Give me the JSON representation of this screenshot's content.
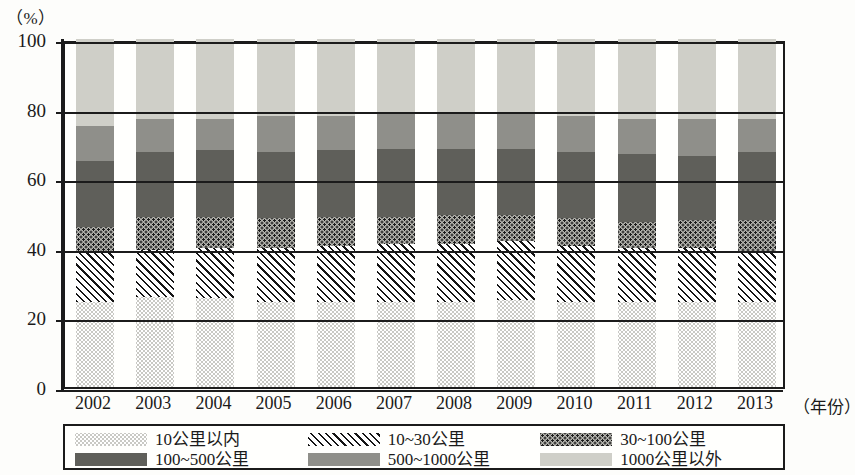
{
  "axis": {
    "unit_label": "（%）",
    "x_axis_name": "（年份）",
    "y_ticks": [
      "0",
      "20",
      "40",
      "60",
      "80",
      "100"
    ]
  },
  "legend": {
    "items": [
      {
        "label": "10公里以内",
        "pattern": "pat-within10"
      },
      {
        "label": "10~30公里",
        "pattern": "pat-10-30"
      },
      {
        "label": "30~100公里",
        "pattern": "pat-30-100"
      },
      {
        "label": "100~500公里",
        "pattern": "pat-100-500"
      },
      {
        "label": "500~1000公里",
        "pattern": "pat-500-1000"
      },
      {
        "label": "1000公里以外",
        "pattern": "pat-1000plus"
      }
    ]
  },
  "chart_data": {
    "type": "bar",
    "subtype": "stacked-percentage",
    "title": "",
    "xlabel": "（年份）",
    "ylabel": "（%）",
    "ylim": [
      0,
      100
    ],
    "ytick_values": [
      0,
      20,
      40,
      60,
      80,
      100
    ],
    "grid": true,
    "legend_position": "bottom",
    "categories": [
      "2002",
      "2003",
      "2004",
      "2005",
      "2006",
      "2007",
      "2008",
      "2009",
      "2010",
      "2011",
      "2012",
      "2013"
    ],
    "series": [
      {
        "name": "10公里以内",
        "values": [
          24.5,
          26.0,
          25.5,
          24.5,
          24.5,
          24.5,
          24.5,
          25.0,
          24.5,
          24.5,
          24.5,
          24.5
        ]
      },
      {
        "name": "10~30公里",
        "values": [
          14.5,
          13.5,
          14.5,
          15.5,
          16.0,
          16.5,
          16.5,
          17.0,
          16.0,
          15.5,
          15.5,
          14.5
        ]
      },
      {
        "name": "30~100公里",
        "values": [
          7.0,
          9.5,
          9.0,
          8.5,
          8.5,
          8.0,
          8.5,
          7.5,
          8.0,
          7.5,
          8.0,
          9.0
        ]
      },
      {
        "name": "100~500公里",
        "values": [
          19.0,
          18.5,
          19.0,
          19.0,
          19.0,
          19.5,
          19.0,
          19.0,
          19.0,
          19.5,
          18.5,
          19.5
        ]
      },
      {
        "name": "500~1000公里",
        "values": [
          10.0,
          9.5,
          9.0,
          10.5,
          10.0,
          10.0,
          10.5,
          10.0,
          10.5,
          10.0,
          10.5,
          9.5
        ]
      },
      {
        "name": "1000公里以外",
        "values": [
          25.0,
          23.0,
          23.0,
          22.0,
          22.0,
          21.5,
          21.0,
          21.5,
          22.0,
          23.0,
          23.0,
          23.0
        ]
      }
    ]
  }
}
